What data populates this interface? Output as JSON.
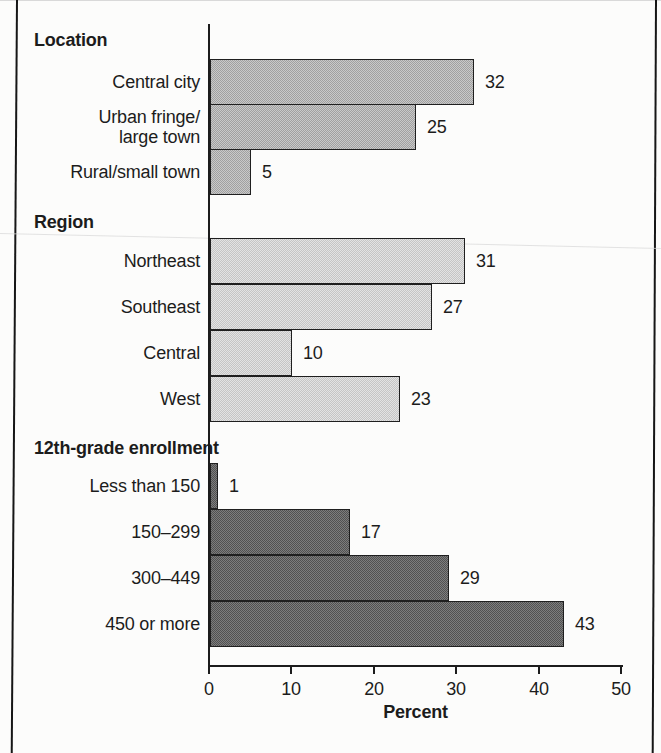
{
  "chart_data": {
    "type": "bar",
    "orientation": "horizontal",
    "title": "",
    "xlabel": "Percent",
    "ylabel": "",
    "xlim": [
      0,
      50
    ],
    "xticks": [
      "0",
      "10",
      "20",
      "30",
      "40",
      "50"
    ],
    "grid": false,
    "legend": false,
    "value_labels_shown": true,
    "groups": [
      {
        "header": "Location",
        "bar_base_color": "#c9c9c9",
        "bar_dot_color": "#a0a0a0",
        "categories": [
          "Central city",
          "Urban fringe/\nlarge town",
          "Rural/small town"
        ],
        "values": [
          32,
          25,
          5
        ]
      },
      {
        "header": "Region",
        "bar_base_color": "#e3e3e3",
        "bar_dot_color": "#c5c5c5",
        "categories": [
          "Northeast",
          "Southeast",
          "Central",
          "West"
        ],
        "values": [
          31,
          27,
          10,
          23
        ]
      },
      {
        "header": "12th-grade enrollment",
        "bar_base_color": "#7d7d7d",
        "bar_dot_color": "#515151",
        "categories": [
          "Less than 150",
          "150–299",
          "300–449",
          "450 or more"
        ],
        "values": [
          1,
          17,
          29,
          43
        ]
      }
    ]
  }
}
